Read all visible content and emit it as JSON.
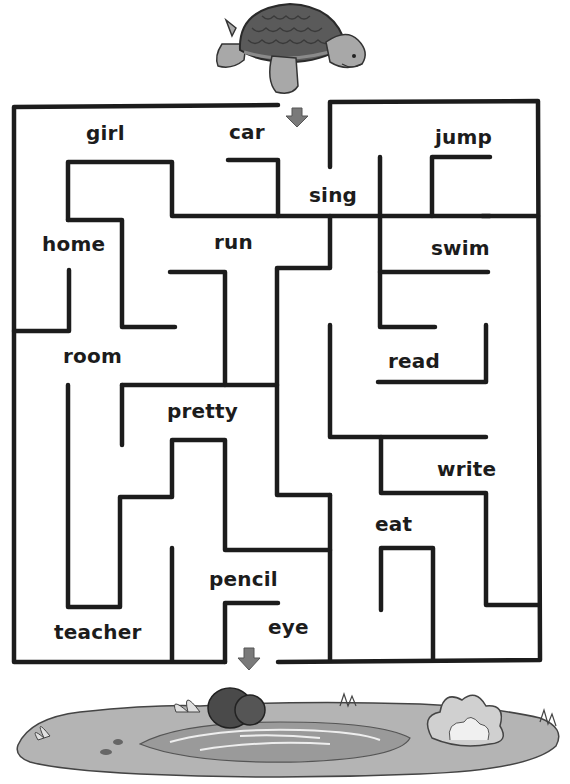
{
  "puzzle": {
    "type": "maze",
    "start_character": "turtle",
    "goal": "pond",
    "entry_arrow": "down-arrow",
    "exit_arrow": "down-arrow",
    "colors": {
      "wall": "#1c1c1c",
      "arrow": "#7a7a7a",
      "shell": "#5a5a5a",
      "skin": "#a8a8a8",
      "pond_ground": "#b4b4b4",
      "water": "#9a9a9a",
      "rock": "#4a4a4a"
    }
  },
  "words": [
    {
      "id": "girl",
      "label": "girl",
      "x": 86,
      "y": 123
    },
    {
      "id": "car",
      "label": "car",
      "x": 229,
      "y": 122
    },
    {
      "id": "jump",
      "label": "jump",
      "x": 435,
      "y": 127
    },
    {
      "id": "sing",
      "label": "sing",
      "x": 309,
      "y": 185
    },
    {
      "id": "home",
      "label": "home",
      "x": 42,
      "y": 234
    },
    {
      "id": "run",
      "label": "run",
      "x": 214,
      "y": 232
    },
    {
      "id": "swim",
      "label": "swim",
      "x": 431,
      "y": 238
    },
    {
      "id": "room",
      "label": "room",
      "x": 63,
      "y": 346
    },
    {
      "id": "read",
      "label": "read",
      "x": 388,
      "y": 351
    },
    {
      "id": "pretty",
      "label": "pretty",
      "x": 167,
      "y": 401
    },
    {
      "id": "write",
      "label": "write",
      "x": 437,
      "y": 459
    },
    {
      "id": "eat",
      "label": "eat",
      "x": 375,
      "y": 514
    },
    {
      "id": "pencil",
      "label": "pencil",
      "x": 209,
      "y": 569
    },
    {
      "id": "eye",
      "label": "eye",
      "x": 268,
      "y": 617
    },
    {
      "id": "teacher",
      "label": "teacher",
      "x": 54,
      "y": 622
    }
  ]
}
